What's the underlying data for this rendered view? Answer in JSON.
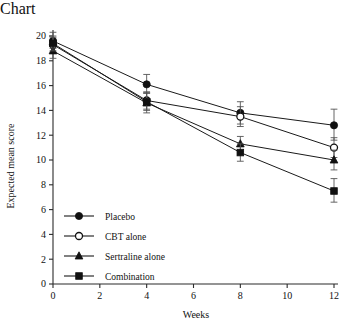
{
  "chart_data": {
    "type": "line",
    "title": "",
    "xlabel": "Weeks",
    "ylabel": "Expected mean score",
    "x": [
      0,
      4,
      8,
      12
    ],
    "xlim": [
      0,
      12
    ],
    "ylim": [
      0,
      20
    ],
    "xticks": [
      0,
      2,
      4,
      6,
      8,
      10,
      12
    ],
    "yticks": [
      0,
      2,
      4,
      6,
      8,
      10,
      12,
      14,
      16,
      18,
      20
    ],
    "grid": false,
    "legend_position": "lower-left-inside",
    "series": [
      {
        "name": "Placebo",
        "marker": "filled-circle",
        "values": [
          19.6,
          16.1,
          13.8,
          12.8
        ],
        "err_low": [
          19.0,
          15.4,
          12.9,
          11.6
        ],
        "err_high": [
          20.3,
          16.9,
          14.7,
          14.1
        ]
      },
      {
        "name": "CBT alone",
        "marker": "open-circle",
        "values": [
          19.3,
          14.8,
          13.5,
          11.0
        ],
        "err_low": [
          18.7,
          14.1,
          12.7,
          10.2
        ],
        "err_high": [
          19.9,
          15.5,
          14.3,
          11.8
        ]
      },
      {
        "name": "Sertraline alone",
        "marker": "filled-triangle",
        "values": [
          18.8,
          14.6,
          11.3,
          10.0
        ],
        "err_low": [
          18.2,
          13.8,
          10.7,
          9.2
        ],
        "err_high": [
          19.4,
          15.4,
          11.9,
          10.8
        ]
      },
      {
        "name": "Combination",
        "marker": "filled-square",
        "values": [
          19.4,
          14.7,
          10.6,
          7.5
        ],
        "err_low": [
          18.8,
          14.0,
          9.9,
          6.6
        ],
        "err_high": [
          20.0,
          15.4,
          11.3,
          8.5
        ]
      }
    ]
  },
  "axis": {
    "xlabel": "Weeks",
    "ylabel": "Expected mean score",
    "xticklabels": [
      "0",
      "2",
      "4",
      "6",
      "8",
      "10",
      "12"
    ],
    "yticklabels": [
      "0",
      "2",
      "4",
      "6",
      "8",
      "10",
      "12",
      "14",
      "16",
      "18",
      "20"
    ]
  },
  "legend": {
    "items": [
      {
        "label": "Placebo",
        "marker": "filled-circle"
      },
      {
        "label": "CBT alone",
        "marker": "open-circle"
      },
      {
        "label": "Sertraline alone",
        "marker": "filled-triangle"
      },
      {
        "label": "Combination",
        "marker": "filled-square"
      }
    ]
  },
  "style": {
    "line_color": "#1a1a1a",
    "marker_fill": "#111111",
    "marker_open_fill": "#ffffff",
    "axis_color": "#2b2b2b",
    "background": "#ffffff"
  }
}
